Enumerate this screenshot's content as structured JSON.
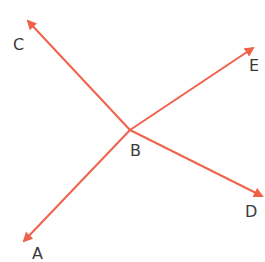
{
  "diagram": {
    "colors": {
      "line": "#f0614a",
      "label": "#3a3a3a",
      "background": "#ffffff"
    },
    "center": {
      "label": "B",
      "x": 130,
      "y": 130
    },
    "rays": [
      {
        "label": "C",
        "tip_x": 26,
        "tip_y": 18
      },
      {
        "label": "E",
        "tip_x": 256,
        "tip_y": 46
      },
      {
        "label": "A",
        "tip_x": 22,
        "tip_y": 244
      },
      {
        "label": "D",
        "tip_x": 264,
        "tip_y": 197
      }
    ],
    "labels": {
      "A": "A",
      "B": "B",
      "C": "C",
      "D": "D",
      "E": "E"
    }
  }
}
